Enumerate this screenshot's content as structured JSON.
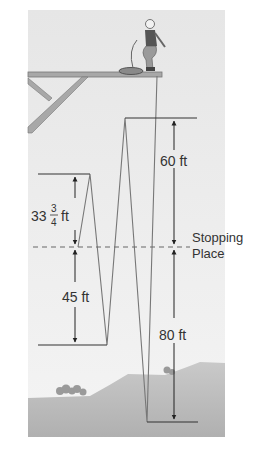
{
  "diagram": {
    "labels": {
      "top_measure": "60 ft",
      "bottom_measure": "80 ft",
      "upper_left_whole": "33",
      "upper_left_num": "3",
      "upper_left_den": "4",
      "upper_left_unit": "ft",
      "lower_left_measure": "45 ft",
      "stopping_line1": "Stopping",
      "stopping_line2": "Place"
    },
    "measurements_ft": {
      "first_drop_below_stop": 80,
      "first_rebound_above_stop": 60,
      "second_drop_below_stop": 45,
      "second_rebound_above_stop": 33.75
    },
    "colors": {
      "background_panel": "#ececec",
      "ground": "#bdbdbd",
      "line": "#333333",
      "dashed": "#666666"
    }
  }
}
